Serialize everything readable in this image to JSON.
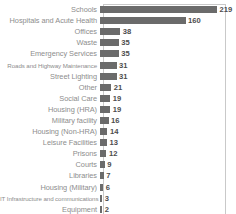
{
  "chart_data": {
    "type": "bar",
    "orientation": "horizontal",
    "title": "",
    "xlabel": "",
    "ylabel": "",
    "grid": false,
    "legend": false,
    "xlim": [
      0,
      230
    ],
    "axis_visible": false,
    "plot_border": true,
    "categories": [
      "Schools",
      "Hospitals and Acute Health",
      "Offices",
      "Waste",
      "Emergency Services",
      "Roads and Highway Maintenance",
      "Street Lighting",
      "Other",
      "Social Care",
      "Housing (HRA)",
      "Military facility",
      "Housing (Non-HRA)",
      "Leisure Facilities",
      "Prisons",
      "Courts",
      "Libraries",
      "Housing (Military)",
      "IT Infrastructure and communications",
      "Equipment"
    ],
    "values": [
      219,
      160,
      38,
      35,
      35,
      31,
      31,
      21,
      19,
      19,
      16,
      14,
      13,
      12,
      9,
      7,
      6,
      3,
      2
    ],
    "value_labels": [
      "219",
      "160",
      "38",
      "35",
      "35",
      "31",
      "31",
      "21",
      "19",
      "19",
      "16",
      "14",
      "13",
      "12",
      "9",
      "7",
      "6",
      "3",
      "2"
    ],
    "colors": {
      "bar": "#6b6b6b",
      "value_label": "#4d4d4d",
      "category_label": "#8d8d8d",
      "plot_border": "#c9c9c9",
      "background": "#ffffff"
    }
  }
}
